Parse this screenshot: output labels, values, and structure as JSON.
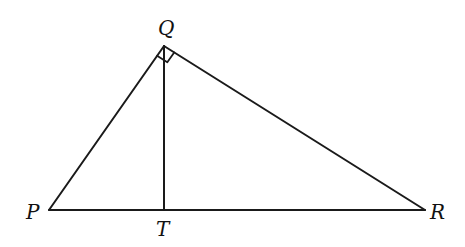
{
  "diagram": {
    "type": "right-triangle-with-altitude",
    "stroke_color": "#1a1a1a",
    "background": "#ffffff",
    "points": {
      "P": {
        "label": "P",
        "x": 49,
        "y": 210
      },
      "Q": {
        "label": "Q",
        "x": 164,
        "y": 46
      },
      "R": {
        "label": "R",
        "x": 425,
        "y": 210
      },
      "T": {
        "label": "T",
        "x": 164,
        "y": 210
      }
    },
    "segments": [
      "PQ",
      "QR",
      "PR",
      "QT"
    ],
    "right_angle_at": "Q"
  }
}
